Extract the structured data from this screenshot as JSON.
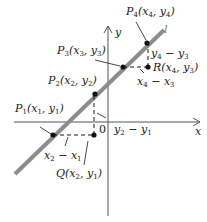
{
  "diagram": {
    "axes": {
      "x_label": "x",
      "y_label": "y",
      "origin_label": "0"
    },
    "line": {
      "label": "l",
      "color": "#8c8c8c"
    },
    "points": [
      {
        "id": "P1",
        "label": "P1(x1, y1)",
        "name": "P",
        "sub": "1",
        "coords": "(x1, y1)"
      },
      {
        "id": "P2",
        "label": "P2(x2, y2)",
        "name": "P",
        "sub": "2",
        "coords": "(x2, y2)"
      },
      {
        "id": "P3",
        "label": "P3(x3, y3)",
        "name": "P",
        "sub": "3",
        "coords": "(x3, y3)"
      },
      {
        "id": "P4",
        "label": "P4(x4, y4)",
        "name": "P",
        "sub": "4",
        "coords": "(x4, y4)"
      },
      {
        "id": "Q",
        "label": "Q(x2, y1)",
        "name": "Q",
        "sub": "",
        "coords": "(x2, y1)"
      },
      {
        "id": "R",
        "label": "R(x4, y3)",
        "name": "R",
        "sub": "",
        "coords": "(x4, y3)"
      }
    ],
    "differences": [
      {
        "id": "run1",
        "label": "x2 − x1"
      },
      {
        "id": "rise1",
        "label": "y2 − y1"
      },
      {
        "id": "run2",
        "label": "x4 − x3"
      },
      {
        "id": "rise2",
        "label": "y4 − y3"
      }
    ],
    "colors": {
      "ink": "#1a1a1a",
      "line": "#8c8c8c"
    }
  }
}
